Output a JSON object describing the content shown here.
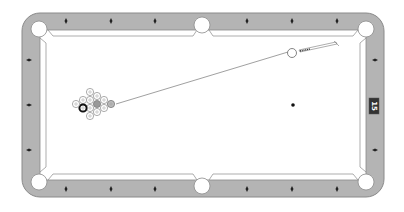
{
  "game": {
    "title": "Pool",
    "rail_badge": "15"
  },
  "colors": {
    "rail": "#b4b4b4",
    "rail_edge": "#8a8a8a",
    "felt": "#ffffff",
    "pocket": "#ffffff",
    "diamond": "#222222",
    "badge_bg": "#333333",
    "aim_line": "#777777",
    "ball_outline": "#888888",
    "eight_ball": "#111111",
    "striped_ball": "#999999"
  },
  "rack": {
    "ball_count": 15,
    "solid_black_ball": "8-ball",
    "lead_ball_style": "grey"
  },
  "cue_ball": {
    "state": "aiming"
  },
  "aim": {
    "target": "rack-head-ball"
  },
  "markers": {
    "foot_spot": "black-dot"
  },
  "pockets": [
    "top-left",
    "top-center",
    "top-right",
    "bottom-left",
    "bottom-center",
    "bottom-right"
  ],
  "diamonds_per_long_rail_side": 3,
  "diamonds_per_short_rail": 3
}
